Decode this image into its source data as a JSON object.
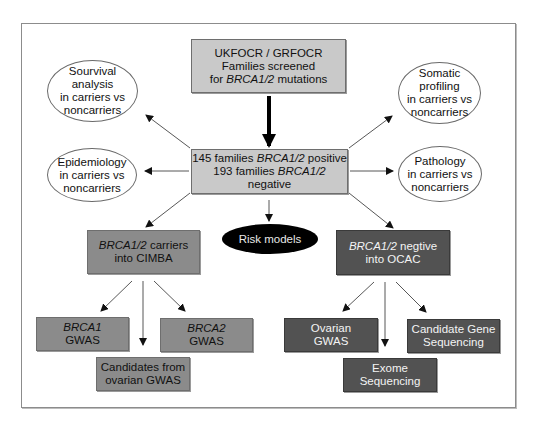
{
  "diagram": {
    "top_box": {
      "line1": "UKFOCR / GRFOCR",
      "line2": "Families screened",
      "line3_prefix": "for ",
      "line3_italic": "BRCA1/2",
      "line3_suffix": " mutations"
    },
    "center_box": {
      "line1_prefix": "145 families ",
      "line1_italic": "BRCA1/2",
      "line1_suffix": " positive",
      "line2_prefix": "193 families ",
      "line2_italic": "BRCA1/2",
      "line2_suffix": " negative"
    },
    "ellipses": {
      "survival": [
        "Sourvival analysis",
        "in carriers vs",
        "noncarriers"
      ],
      "epidemiology": [
        "Epidemiology",
        "in carriers vs",
        "noncarriers"
      ],
      "somatic": [
        "Somatic profiling",
        "in carriers vs",
        "noncarriers"
      ],
      "pathology": [
        "Pathology",
        "in carriers vs",
        "noncarriers"
      ]
    },
    "risk_models": "Risk models",
    "cimba_box": {
      "line1_italic": "BRCA1/2",
      "line1_suffix": " carriers",
      "line2": "into CIMBA"
    },
    "ocac_box": {
      "line1_italic": "BRCA1/2",
      "line1_suffix": " negtive",
      "line2": "into OCAC"
    },
    "brca1_gwas": {
      "line1_italic": "BRCA1",
      "line2": "GWAS"
    },
    "brca2_gwas": {
      "line1_italic": "BRCA2",
      "line2": "GWAS"
    },
    "candidates_box": {
      "line1": "Candidates from",
      "line2": "ovarian GWAS"
    },
    "ovarian_gwas": {
      "line1": "Ovarian",
      "line2": "GWAS"
    },
    "candidate_gene": {
      "line1": "Candidate Gene",
      "line2": "Sequencing"
    },
    "exome": {
      "line1": "Exome",
      "line2": "Sequencing"
    },
    "colors": {
      "light_box": "#c9c9c9",
      "mid_box": "#8b8b8b",
      "dark_box": "#525252",
      "risk_ellipse": "#000000",
      "frame": "#8c8c8c"
    }
  }
}
